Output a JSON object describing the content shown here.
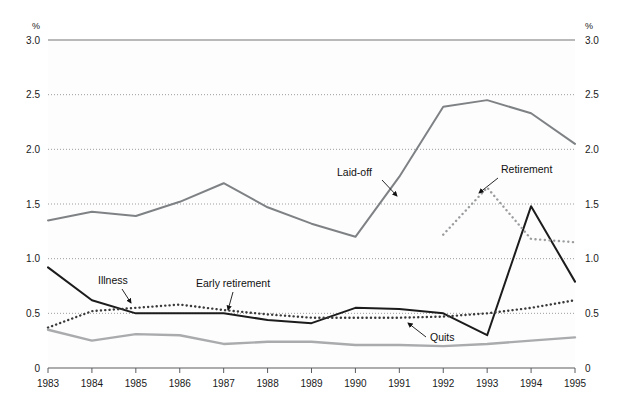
{
  "chart_data": {
    "type": "line",
    "title": "",
    "xlabel": "",
    "ylabel": "%",
    "y_right_label": "%",
    "ylim": [
      0,
      3.0
    ],
    "yticks": [
      "0",
      "0.5",
      "1.0",
      "1.5",
      "2.0",
      "2.5",
      "3.0"
    ],
    "ytick_values": [
      0,
      0.5,
      1.0,
      1.5,
      2.0,
      2.5,
      3.0
    ],
    "categories": [
      "1983",
      "1984",
      "1985",
      "1986",
      "1987",
      "1988",
      "1989",
      "1990",
      "1991",
      "1992",
      "1993",
      "1994",
      "1995"
    ],
    "grid": true,
    "grid_style": "dotted-horizontal",
    "legend_position": "inline-annotations",
    "series": [
      {
        "name": "Laid-off",
        "style": "solid",
        "color": "#7f8285",
        "width": 2.0,
        "values": [
          1.35,
          1.43,
          1.39,
          1.52,
          1.69,
          1.47,
          1.32,
          1.2,
          1.75,
          2.39,
          2.45,
          2.33,
          2.05
        ]
      },
      {
        "name": "Early retirement",
        "style": "solid",
        "color": "#1c1c1c",
        "width": 2.0,
        "values": [
          0.92,
          0.65,
          0.5,
          0.5,
          0.5,
          0.44,
          0.41,
          0.48,
          0.4,
          0.3,
          0.44,
          0.46,
          0.46
        ]
      },
      {
        "name": "Illness",
        "style": "dotted",
        "color": "#3a3a3a",
        "width": 2.4,
        "values": [
          0.37,
          0.52,
          0.55,
          0.58,
          0.53,
          0.49,
          0.46,
          0.46,
          0.46,
          0.47,
          0.5,
          0.55,
          0.62
        ]
      },
      {
        "name": "Quits",
        "style": "solid",
        "color": "#a9abad",
        "width": 2.4,
        "values": [
          0.35,
          0.25,
          0.31,
          0.3,
          0.22,
          0.24,
          0.24,
          0.21,
          0.21,
          0.2,
          0.22,
          0.25,
          0.28
        ]
      },
      {
        "name": "Retirement",
        "style": "dotted",
        "color": "#9a9c9e",
        "width": 2.4,
        "values": [
          null,
          null,
          null,
          null,
          null,
          null,
          null,
          null,
          null,
          1.22,
          1.65,
          1.18,
          1.15
        ]
      }
    ],
    "note_series_segments": {
      "Early retirement_late": {
        "comment": "black solid continues: 1991=0.30 -> 1992=1.48 -> 1993=0.79 -> 1994=0.79 -> 1995=0.82"
      }
    },
    "series_full": [
      {
        "name": "Laid-off",
        "style": "solid",
        "color": "#7f8285",
        "width": 2.0,
        "points": [
          {
            "x": "1983",
            "y": 1.35
          },
          {
            "x": "1984",
            "y": 1.43
          },
          {
            "x": "1985",
            "y": 1.39
          },
          {
            "x": "1986",
            "y": 1.52
          },
          {
            "x": "1987",
            "y": 1.69
          },
          {
            "x": "1988",
            "y": 1.47
          },
          {
            "x": "1989",
            "y": 1.32
          },
          {
            "x": "1990",
            "y": 1.2
          },
          {
            "x": "1991",
            "y": 1.75
          },
          {
            "x": "1992",
            "y": 2.39
          },
          {
            "x": "1993",
            "y": 2.45
          },
          {
            "x": "1994",
            "y": 2.33
          },
          {
            "x": "1995",
            "y": 2.05
          }
        ]
      },
      {
        "name": "Early retirement",
        "style": "solid",
        "color": "#1c1c1c",
        "width": 2.0,
        "points": [
          {
            "x": "1983",
            "y": 0.92
          },
          {
            "x": "1984",
            "y": 0.62
          },
          {
            "x": "1985",
            "y": 0.5
          },
          {
            "x": "1986",
            "y": 0.5
          },
          {
            "x": "1987",
            "y": 0.5
          },
          {
            "x": "1988",
            "y": 0.44
          },
          {
            "x": "1989",
            "y": 0.41
          },
          {
            "x": "1990",
            "y": 0.55
          },
          {
            "x": "1991",
            "y": 0.54
          },
          {
            "x": "1992",
            "y": 0.5
          },
          {
            "x": "1993",
            "y": 0.3
          },
          {
            "x": "1994",
            "y": 1.48
          },
          {
            "x": "1995",
            "y": 0.79
          }
        ]
      },
      {
        "name": "Illness",
        "style": "dotted",
        "color": "#3a3a3a",
        "width": 2.4,
        "points": [
          {
            "x": "1983",
            "y": 0.37
          },
          {
            "x": "1984",
            "y": 0.52
          },
          {
            "x": "1985",
            "y": 0.55
          },
          {
            "x": "1986",
            "y": 0.58
          },
          {
            "x": "1987",
            "y": 0.53
          },
          {
            "x": "1988",
            "y": 0.49
          },
          {
            "x": "1989",
            "y": 0.46
          },
          {
            "x": "1990",
            "y": 0.46
          },
          {
            "x": "1991",
            "y": 0.46
          },
          {
            "x": "1992",
            "y": 0.47
          },
          {
            "x": "1993",
            "y": 0.5
          },
          {
            "x": "1994",
            "y": 0.55
          },
          {
            "x": "1995",
            "y": 0.62
          }
        ]
      },
      {
        "name": "Quits",
        "style": "solid",
        "color": "#a9abad",
        "width": 2.4,
        "points": [
          {
            "x": "1983",
            "y": 0.35
          },
          {
            "x": "1984",
            "y": 0.25
          },
          {
            "x": "1985",
            "y": 0.31
          },
          {
            "x": "1986",
            "y": 0.3
          },
          {
            "x": "1987",
            "y": 0.22
          },
          {
            "x": "1988",
            "y": 0.24
          },
          {
            "x": "1989",
            "y": 0.24
          },
          {
            "x": "1990",
            "y": 0.21
          },
          {
            "x": "1991",
            "y": 0.21
          },
          {
            "x": "1992",
            "y": 0.2
          },
          {
            "x": "1993",
            "y": 0.22
          },
          {
            "x": "1994",
            "y": 0.25
          },
          {
            "x": "1995",
            "y": 0.28
          }
        ]
      }
    ],
    "annotations": [
      {
        "label": "Laid-off",
        "label_x": 337,
        "label_y": 176,
        "arrow_from_x": 382,
        "arrow_from_y": 180,
        "arrow_to_x": 397,
        "arrow_to_y": 196
      },
      {
        "label": "Retirement",
        "label_x": 501,
        "label_y": 173,
        "arrow_from_x": 498,
        "arrow_from_y": 178,
        "arrow_to_x": 479,
        "arrow_to_y": 193
      },
      {
        "label": "Illness",
        "label_x": 98,
        "label_y": 284,
        "arrow_from_x": 122,
        "arrow_from_y": 289,
        "arrow_to_x": 131,
        "arrow_to_y": 303
      },
      {
        "label": "Early retirement",
        "label_x": 196,
        "label_y": 287,
        "arrow_from_x": 233,
        "arrow_from_y": 292,
        "arrow_to_x": 228,
        "arrow_to_y": 310
      },
      {
        "label": "Quits",
        "label_x": 430,
        "label_y": 341,
        "arrow_from_x": 426,
        "arrow_from_y": 337,
        "arrow_to_x": 408,
        "arrow_to_y": 323
      }
    ]
  },
  "axis": {
    "unit_left": "%",
    "unit_right": "%"
  }
}
